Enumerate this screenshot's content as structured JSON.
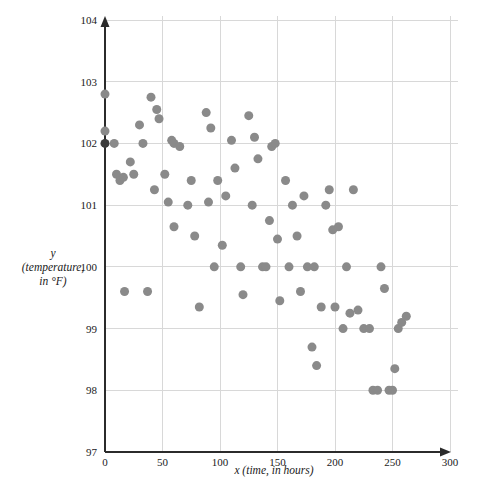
{
  "chart_data": {
    "type": "scatter",
    "title": "",
    "xlabel": "x (time, in hours)",
    "ylabel": "y (temperature, in °F)",
    "ylabel_lines": [
      "y",
      "(temperature,",
      "in °F)"
    ],
    "xlim": [
      0,
      300
    ],
    "ylim": [
      97,
      104
    ],
    "xticks": [
      0,
      50,
      100,
      150,
      200,
      250,
      300
    ],
    "yticks": [
      97,
      98,
      99,
      100,
      101,
      102,
      103,
      104
    ],
    "xtick_labels": [
      "0",
      "50",
      "100",
      "150",
      "200",
      "250",
      "300"
    ],
    "ytick_labels": [
      "97",
      "98",
      "99",
      "100",
      "101",
      "102",
      "103",
      "104"
    ],
    "grid": true,
    "legend": null,
    "marker_color": "#8a8a8a",
    "highlight_color": "#3a3a3a",
    "marker_size": 9,
    "points": [
      {
        "x": 0,
        "y": 102.8
      },
      {
        "x": 0,
        "y": 102.2
      },
      {
        "x": 0,
        "y": 102.0,
        "highlight": true
      },
      {
        "x": 8,
        "y": 102.0
      },
      {
        "x": 10,
        "y": 101.5
      },
      {
        "x": 13,
        "y": 101.4
      },
      {
        "x": 16,
        "y": 101.45
      },
      {
        "x": 17,
        "y": 99.6
      },
      {
        "x": 22,
        "y": 101.7
      },
      {
        "x": 25,
        "y": 101.5
      },
      {
        "x": 30,
        "y": 102.3
      },
      {
        "x": 33,
        "y": 102.0
      },
      {
        "x": 37,
        "y": 99.6
      },
      {
        "x": 40,
        "y": 102.75
      },
      {
        "x": 43,
        "y": 101.25
      },
      {
        "x": 45,
        "y": 102.55
      },
      {
        "x": 47,
        "y": 102.4
      },
      {
        "x": 52,
        "y": 101.5
      },
      {
        "x": 55,
        "y": 101.05
      },
      {
        "x": 58,
        "y": 102.05
      },
      {
        "x": 60,
        "y": 102.0
      },
      {
        "x": 60,
        "y": 100.65
      },
      {
        "x": 65,
        "y": 101.95
      },
      {
        "x": 72,
        "y": 101.0
      },
      {
        "x": 75,
        "y": 101.4
      },
      {
        "x": 78,
        "y": 100.5
      },
      {
        "x": 82,
        "y": 99.35
      },
      {
        "x": 88,
        "y": 102.5
      },
      {
        "x": 90,
        "y": 101.05
      },
      {
        "x": 92,
        "y": 102.25
      },
      {
        "x": 95,
        "y": 100.0
      },
      {
        "x": 98,
        "y": 101.4
      },
      {
        "x": 102,
        "y": 100.35
      },
      {
        "x": 105,
        "y": 101.15
      },
      {
        "x": 110,
        "y": 102.05
      },
      {
        "x": 113,
        "y": 101.6
      },
      {
        "x": 118,
        "y": 100.0
      },
      {
        "x": 120,
        "y": 99.55
      },
      {
        "x": 125,
        "y": 102.45
      },
      {
        "x": 128,
        "y": 101.0
      },
      {
        "x": 130,
        "y": 102.1
      },
      {
        "x": 133,
        "y": 101.75
      },
      {
        "x": 137,
        "y": 100.0
      },
      {
        "x": 140,
        "y": 100.0
      },
      {
        "x": 143,
        "y": 100.75
      },
      {
        "x": 145,
        "y": 101.95
      },
      {
        "x": 148,
        "y": 102.0
      },
      {
        "x": 150,
        "y": 100.45
      },
      {
        "x": 152,
        "y": 99.45
      },
      {
        "x": 157,
        "y": 101.4
      },
      {
        "x": 160,
        "y": 100.0
      },
      {
        "x": 163,
        "y": 101.0
      },
      {
        "x": 167,
        "y": 100.5
      },
      {
        "x": 170,
        "y": 99.6
      },
      {
        "x": 173,
        "y": 101.15
      },
      {
        "x": 176,
        "y": 100.0
      },
      {
        "x": 180,
        "y": 98.7
      },
      {
        "x": 182,
        "y": 100.0
      },
      {
        "x": 184,
        "y": 98.4
      },
      {
        "x": 188,
        "y": 99.35
      },
      {
        "x": 192,
        "y": 101.0
      },
      {
        "x": 195,
        "y": 101.25
      },
      {
        "x": 198,
        "y": 100.6
      },
      {
        "x": 200,
        "y": 99.35
      },
      {
        "x": 203,
        "y": 100.65
      },
      {
        "x": 207,
        "y": 99.0
      },
      {
        "x": 210,
        "y": 100.0
      },
      {
        "x": 213,
        "y": 99.25
      },
      {
        "x": 216,
        "y": 101.25
      },
      {
        "x": 220,
        "y": 99.3
      },
      {
        "x": 225,
        "y": 99.0
      },
      {
        "x": 230,
        "y": 99.0
      },
      {
        "x": 233,
        "y": 98.0
      },
      {
        "x": 237,
        "y": 98.0
      },
      {
        "x": 240,
        "y": 100.0
      },
      {
        "x": 243,
        "y": 99.65
      },
      {
        "x": 247,
        "y": 98.0
      },
      {
        "x": 250,
        "y": 98.0
      },
      {
        "x": 252,
        "y": 98.35
      },
      {
        "x": 255,
        "y": 99.0
      },
      {
        "x": 258,
        "y": 99.1
      },
      {
        "x": 262,
        "y": 99.2
      }
    ]
  }
}
